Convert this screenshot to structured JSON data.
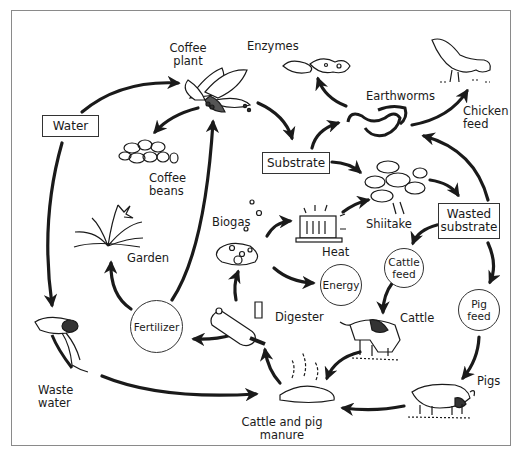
{
  "diagram": {
    "type": "integrated coffee farming nutrient cycle",
    "nodes": {
      "coffee_plant": "Coffee\nplant",
      "enzymes": "Enzymes",
      "earthworms": "Earthworms",
      "chicken_feed": "Chicken\nfeed",
      "water": "Water",
      "coffee_beans": "Coffee\nbeans",
      "substrate": "Substrate",
      "shiitake": "Shiitake",
      "wasted_substrate": "Wasted\nsubstrate",
      "garden": "Garden",
      "biogas": "Biogas",
      "heat": "Heat",
      "energy": "Energy",
      "cattle_feed": "Cattle\nfeed",
      "pig_feed": "Pig\nfeed",
      "fertilizer": "Fertilizer",
      "digester": "Digester",
      "cattle": "Cattle",
      "pigs": "Pigs",
      "waste_water": "Waste\nwater",
      "manure": "Cattle and pig\nmanure"
    },
    "edges": [
      {
        "from": "Water",
        "to": "Coffee plant"
      },
      {
        "from": "Water",
        "to": "Waste water"
      },
      {
        "from": "Coffee plant",
        "to": "Coffee beans"
      },
      {
        "from": "Coffee plant",
        "to": "Substrate"
      },
      {
        "from": "Substrate",
        "to": "Earthworms"
      },
      {
        "from": "Substrate",
        "to": "Shiitake"
      },
      {
        "from": "Earthworms",
        "to": "Enzymes"
      },
      {
        "from": "Earthworms",
        "to": "Chicken feed"
      },
      {
        "from": "Wasted substrate",
        "to": "Earthworms"
      },
      {
        "from": "Shiitake",
        "to": "Wasted substrate"
      },
      {
        "from": "Wasted substrate",
        "to": "Cattle feed"
      },
      {
        "from": "Wasted substrate",
        "to": "Pig feed"
      },
      {
        "from": "Cattle feed",
        "to": "Cattle"
      },
      {
        "from": "Pig feed",
        "to": "Pigs"
      },
      {
        "from": "Cattle",
        "to": "Cattle and pig manure"
      },
      {
        "from": "Pigs",
        "to": "Cattle and pig manure"
      },
      {
        "from": "Waste water",
        "to": "Cattle and pig manure"
      },
      {
        "from": "Cattle and pig manure",
        "to": "Digester"
      },
      {
        "from": "Digester",
        "to": "Biogas"
      },
      {
        "from": "Digester",
        "to": "Fertilizer"
      },
      {
        "from": "Biogas",
        "to": "Heat"
      },
      {
        "from": "Biogas",
        "to": "Energy"
      },
      {
        "from": "Heat",
        "to": "Shiitake"
      },
      {
        "from": "Fertilizer",
        "to": "Garden"
      },
      {
        "from": "Fertilizer",
        "to": "Coffee plant"
      }
    ]
  },
  "colors": {
    "ink": "#1a1a1a",
    "frame": "#8a8a8a",
    "background": "#ffffff"
  }
}
